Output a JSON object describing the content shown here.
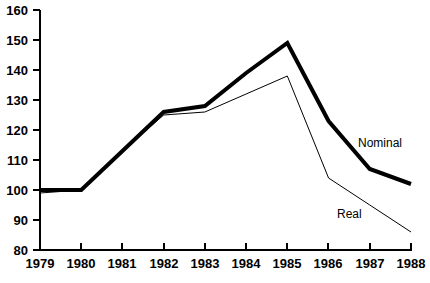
{
  "chart_data": {
    "type": "line",
    "title": "",
    "subtitle": "",
    "xlabel": "",
    "ylabel": "",
    "x": [
      1979,
      1980,
      1981,
      1982,
      1983,
      1984,
      1985,
      1986,
      1987,
      1988
    ],
    "categories": [
      "1979",
      "1980",
      "1981",
      "1982",
      "1983",
      "1984",
      "1985",
      "1986",
      "1987",
      "1988"
    ],
    "series": [
      {
        "name": "Nominal",
        "values": [
          100,
          100,
          113,
          126,
          128,
          139,
          149,
          123,
          107,
          102
        ],
        "color": "#000000",
        "line_width": 4,
        "label_position": {
          "x": 358,
          "y": 137
        }
      },
      {
        "name": "Real",
        "values": [
          99,
          100,
          113,
          125,
          126,
          132,
          138,
          104,
          95,
          86
        ],
        "color": "#000000",
        "line_width": 1,
        "label_position": {
          "x": 337,
          "y": 208
        }
      }
    ],
    "xlim": [
      1979,
      1988
    ],
    "ylim": [
      80,
      160
    ],
    "y_ticks": [
      80,
      90,
      100,
      110,
      120,
      130,
      140,
      150,
      160
    ],
    "y_tick_labels": [
      "80",
      "90",
      "100",
      "110",
      "120",
      "130",
      "140",
      "150",
      "160"
    ],
    "x_ticks": [
      1979,
      1980,
      1981,
      1982,
      1983,
      1984,
      1985,
      1986,
      1987,
      1988
    ],
    "x_tick_labels": [
      "1979",
      "1980",
      "1981",
      "1982",
      "1983",
      "1984",
      "1985",
      "1986",
      "1987",
      "1988"
    ],
    "grid": false,
    "legend": "inline-annotations",
    "legend_position": "inside-right",
    "axis_color": "#000000",
    "background_color": "#ffffff"
  },
  "axes": {
    "y_labels": [
      "160",
      "150",
      "140",
      "130",
      "120",
      "110",
      "100",
      "90",
      "80"
    ],
    "x_labels": [
      "1979",
      "1980",
      "1981",
      "1982",
      "1983",
      "1984",
      "1985",
      "1986",
      "1987",
      "1988"
    ]
  },
  "annotations": {
    "nominal_label": "Nominal",
    "real_label": "Real"
  }
}
